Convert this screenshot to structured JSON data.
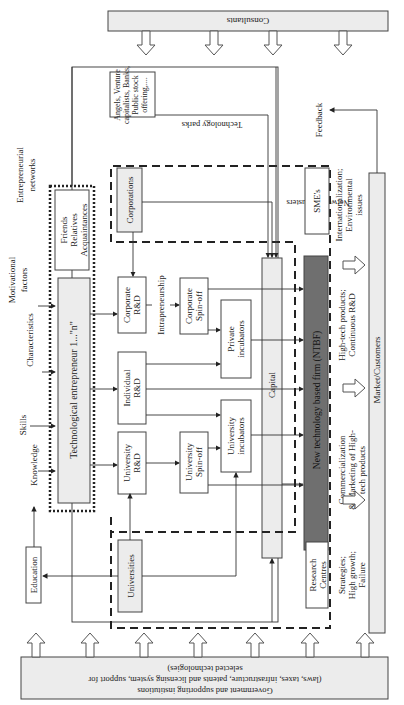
{
  "diagram": {
    "banners": {
      "top": "Consultants",
      "bottom_line1": "Government and supporting institutions",
      "bottom_line2": "(laws, taxes, infrastructure, patents and licensing system, support for",
      "bottom_line3": "selected technologies)"
    },
    "inputs": {
      "knowledge": "Knowledge",
      "skills": "Skills",
      "characteristics": "Characteristics",
      "motivational_1": "Motivational",
      "motivational_2": "factors",
      "networks_1": "Entrepreneurial",
      "networks_2": "networks",
      "education": "Education"
    },
    "nodes": {
      "entrepreneur": "Technological entrepreneur 1...\"n\"",
      "friends": "Friends",
      "relatives": "Relatives",
      "acquaintances": "Acquaintances",
      "university_rd_1": "University",
      "university_rd_2": "R&D",
      "individual_rd_1": "Individual",
      "individual_rd_2": "R&D",
      "corporate_rd_1": "Corporate",
      "corporate_rd_2": "R&D",
      "intrapreneurship": "Intrapreneurship",
      "university_spinoff_1": "University",
      "university_spinoff_2": "Spin-off",
      "corporate_spinoff_1": "Corporate",
      "corporate_spinoff_2": "Spin-off",
      "university_incubators_1": "University",
      "university_incubators_2": "incubators",
      "private_incubators_1": "Private",
      "private_incubators_2": "incubators",
      "capital": "Capital",
      "ntbf": "New technology based firm (NTBF)",
      "universities": "Universities",
      "corporations": "Corporations",
      "research_centres_1": "Research",
      "research_centres_2": "Centres",
      "smes": "SME's",
      "investors_1": "Angels, Venture",
      "investors_2": "capitalists, Banks,",
      "investors_3": "Public stock",
      "investors_4": "offering,....",
      "technology_parks": "Technology parks",
      "networks_clusters": "Networks, clusters"
    },
    "outcomes": {
      "strategies_1": "Strategies;",
      "strategies_2": "High growth;",
      "strategies_3": "Failure",
      "commercialization_1": "Commercialization",
      "commercialization_2": "& Marketing of High-",
      "commercialization_3": "tech products",
      "hightech_1": "High-tech products;",
      "hightech_2": "Continuous R&D",
      "international_1": "Internationalization;",
      "international_2": "Environmental",
      "international_3": "issues",
      "market": "Market/Customers",
      "feedback": "Feedback"
    }
  }
}
